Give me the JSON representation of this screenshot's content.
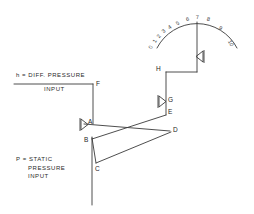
{
  "diagram": {
    "stroke_color": "#3a3a3a",
    "background_color": "#ffffff",
    "annotations": {
      "diff_pressure": {
        "top_line": "h = DIFF. PRESSURE",
        "bottom_line": "INPUT"
      },
      "static_pressure": {
        "line1": "P = STATIC",
        "line2": "PRESSURE",
        "line3": "INPUT"
      }
    },
    "points": [
      {
        "id": "A",
        "label": "A",
        "x": 88,
        "y": 124
      },
      {
        "id": "B",
        "label": "B",
        "x": 86,
        "y": 143
      },
      {
        "id": "C",
        "label": "C",
        "x": 97,
        "y": 169
      },
      {
        "id": "D",
        "label": "D",
        "x": 172,
        "y": 131
      },
      {
        "id": "E",
        "label": "E",
        "x": 166,
        "y": 113
      },
      {
        "id": "F",
        "label": "F",
        "x": 95,
        "y": 85
      },
      {
        "id": "G",
        "label": "G",
        "x": 166,
        "y": 101
      },
      {
        "id": "H",
        "label": "H",
        "x": 158,
        "y": 69
      }
    ],
    "pivots": [
      {
        "id": "pivot-a",
        "at": "A",
        "direction": "right"
      },
      {
        "id": "pivot-g",
        "at": "G",
        "direction": "right"
      },
      {
        "id": "pivot-needle",
        "at": "needle",
        "direction": "left"
      }
    ],
    "scale": {
      "ticks": [
        "0",
        "1",
        "2",
        "3",
        "4",
        "5",
        "6",
        "7",
        "8",
        "9",
        "10"
      ],
      "min": 0,
      "max": 10,
      "needle_value": 7
    }
  }
}
